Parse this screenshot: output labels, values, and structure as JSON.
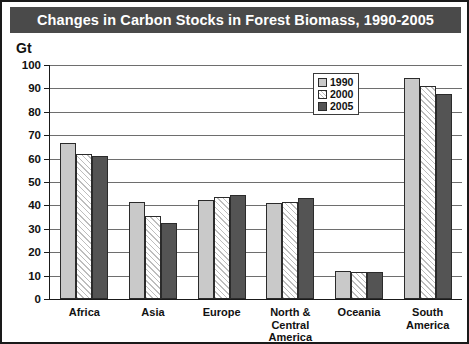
{
  "title": "Changes in Carbon Stocks in Forest Biomass, 1990-2005",
  "y_unit": "Gt",
  "legend": {
    "entries": [
      {
        "label": "1990",
        "swatch": "light-gray-swatch",
        "color": "#c9c9c9"
      },
      {
        "label": "2000",
        "swatch": "white-hatched-swatch",
        "color": "#ffffff"
      },
      {
        "label": "2005",
        "swatch": "dark-gray-swatch",
        "color": "#545454"
      }
    ]
  },
  "y_ticks": [
    "0",
    "10",
    "20",
    "30",
    "40",
    "50",
    "60",
    "70",
    "80",
    "90",
    "100"
  ],
  "categories": [
    "Africa",
    "Asia",
    "Europe",
    "North &\nCentral\nAmerica",
    "Oceania",
    "South\nAmerica"
  ],
  "chart_data": {
    "type": "bar",
    "title": "Changes in Carbon Stocks in Forest Biomass, 1990-2005",
    "xlabel": "",
    "ylabel": "Gt",
    "ylim": [
      0,
      100
    ],
    "ytick_step": 10,
    "grid": true,
    "legend_position": "inside-top-right",
    "categories": [
      "Africa",
      "Asia",
      "Europe",
      "North & Central America",
      "Oceania",
      "South America"
    ],
    "series": [
      {
        "name": "1990",
        "color": "#c9c9c9",
        "values": [
          66.5,
          41.5,
          42.5,
          41.0,
          12.0,
          94.5
        ]
      },
      {
        "name": "2000",
        "color": "#ffffff",
        "values": [
          62.0,
          35.5,
          43.5,
          41.5,
          11.5,
          91.0
        ]
      },
      {
        "name": "2005",
        "color": "#545454",
        "values": [
          61.0,
          32.5,
          44.5,
          43.0,
          11.5,
          87.5
        ]
      }
    ]
  }
}
